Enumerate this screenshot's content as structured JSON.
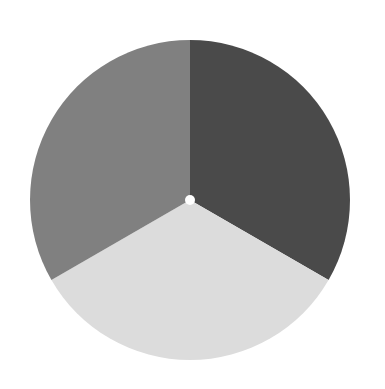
{
  "chart_data": {
    "type": "pie",
    "title": "",
    "subtitle": "",
    "xlabel": "",
    "ylabel": "",
    "grid": false,
    "legend": false,
    "legend_position": "none",
    "background_color": "#ffffff",
    "center": {
      "x": 190,
      "y": 200
    },
    "radius": 160,
    "inner_radius": 5,
    "inner_hole_color": "#ffffff",
    "start_angle_deg": -90,
    "direction": "clockwise",
    "categories": [
      "Segment 1",
      "Segment 2",
      "Segment 3"
    ],
    "values": [
      33.3,
      33.3,
      33.3
    ],
    "slices": [
      {
        "label": "Segment 1",
        "value": 33.3,
        "percent": "33.3%",
        "color": "#4a4a4a",
        "start_angle_deg": -90,
        "end_angle_deg": 30,
        "position": "top-right"
      },
      {
        "label": "Segment 2",
        "value": 33.3,
        "percent": "33.3%",
        "color": "#dcdcdc",
        "start_angle_deg": 30,
        "end_angle_deg": 150,
        "position": "bottom"
      },
      {
        "label": "Segment 3",
        "value": 33.3,
        "percent": "33.3%",
        "color": "#808080",
        "start_angle_deg": 150,
        "end_angle_deg": 270,
        "position": "top-left"
      }
    ],
    "annotations": []
  },
  "colors": {
    "slice_dark": "#4a4a4a",
    "slice_light": "#dcdcdc",
    "slice_medium": "#808080",
    "background": "#ffffff",
    "hole": "#ffffff"
  }
}
